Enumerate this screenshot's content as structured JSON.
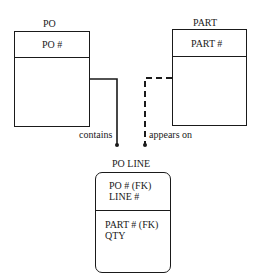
{
  "entities": {
    "po": {
      "name": "PO",
      "keys": [
        "PO #"
      ],
      "attributes": []
    },
    "part": {
      "name": "PART",
      "keys": [
        "PART #"
      ],
      "attributes": []
    },
    "po_line": {
      "name": "PO LINE",
      "keys": [
        "PO # (FK)",
        "LINE #"
      ],
      "attributes": [
        "PART # (FK)",
        "QTY"
      ]
    }
  },
  "relationships": [
    {
      "from": "PO",
      "to": "PO LINE",
      "label": "contains",
      "style": "solid",
      "identifying": true
    },
    {
      "from": "PART",
      "to": "PO LINE",
      "label": "appears on",
      "style": "dashed",
      "identifying": false
    }
  ],
  "colors": {
    "line": "#1a1a1a",
    "background": "#ffffff"
  }
}
